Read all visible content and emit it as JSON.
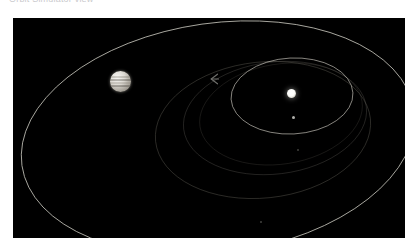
{
  "caption": {
    "text": "Orbit Simulator view",
    "visible_note": "clipped at top edge"
  },
  "viewport": {
    "label": "orbit-diagram",
    "background_color": "#000000",
    "width": 392,
    "height": 220
  },
  "scene": {
    "title": "Solar system orbital view",
    "orbit_line_color": "#d6d4cc",
    "faint_orbit_color": "#4a4740",
    "bodies": [
      {
        "id": "central-star",
        "name": "Sun",
        "type": "star",
        "color": "#ffffff",
        "cx": 279,
        "cy": 76,
        "radius": 4.5
      },
      {
        "id": "gas-giant",
        "name": "Gas giant planet",
        "type": "planet",
        "color": "#d9d5ce",
        "cx": 108,
        "cy": 64,
        "radius": 10.5,
        "banded": true
      },
      {
        "id": "inner-planet",
        "name": "Inner planet",
        "type": "planet",
        "color": "#cfcfc9",
        "cx": 281,
        "cy": 100,
        "radius": 1.6
      },
      {
        "id": "far-dot",
        "name": "Distant body",
        "type": "marker",
        "color": "#8d8d88",
        "cx": 285,
        "cy": 132,
        "radius": 1.0
      },
      {
        "id": "lower-dot",
        "name": "Distant body lower",
        "type": "marker",
        "color": "#8d8d88",
        "cx": 248,
        "cy": 204,
        "radius": 0.9
      }
    ],
    "orbits": [
      {
        "id": "outer-orbit",
        "name": "Outer planet orbit",
        "cx": 205,
        "cy": 120,
        "rx": 198,
        "ry": 115,
        "rotation": -8,
        "stroke": "#cfcdc4",
        "opacity": 0.85,
        "width": 0.9
      },
      {
        "id": "middle-orbit",
        "name": "Middle orbit",
        "cx": 250,
        "cy": 112,
        "rx": 108,
        "ry": 68,
        "rotation": -6,
        "stroke": "#5e5b53",
        "opacity": 0.55,
        "width": 0.8
      },
      {
        "id": "inner-orbit",
        "name": "Inner planet orbit",
        "cx": 279,
        "cy": 78,
        "rx": 61,
        "ry": 38,
        "rotation": -3,
        "stroke": "#cecbc2",
        "opacity": 0.8,
        "width": 0.8
      },
      {
        "id": "faint-arc-a",
        "name": "Faint orbit arc upper",
        "cx": 262,
        "cy": 100,
        "rx": 92,
        "ry": 56,
        "rotation": -7,
        "stroke": "#6b6760",
        "opacity": 0.45,
        "width": 0.7
      },
      {
        "id": "faint-arc-b",
        "name": "Faint orbit arc second",
        "cx": 268,
        "cy": 96,
        "rx": 82,
        "ry": 50,
        "rotation": -9,
        "stroke": "#57544d",
        "opacity": 0.38,
        "width": 0.7
      }
    ],
    "markers": [
      {
        "id": "spacecraft",
        "name": "Spacecraft marker",
        "glyph": "⟨",
        "cx": 201,
        "cy": 61,
        "color": "#9c9c97"
      }
    ]
  }
}
